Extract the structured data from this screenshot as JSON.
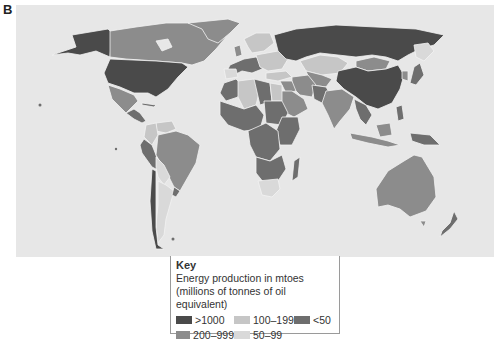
{
  "panel_label": "B",
  "legend": {
    "title": "Key",
    "subtitle_line1": "Energy production in mtoes",
    "subtitle_line2": "(millions of tonnes of oil equivalent)",
    "items": [
      {
        "label": ">1000",
        "color": "#4a4a4a"
      },
      {
        "label": "100–199",
        "color": "#c6c6c6"
      },
      {
        "label": "<50",
        "color": "#6e6e6e"
      },
      {
        "label": "200–999",
        "color": "#8c8c8c"
      },
      {
        "label": "50–99",
        "color": "#d9d9d9"
      }
    ]
  },
  "map": {
    "ocean_color": "#e7e7e7",
    "border_color": "#f2f2f2",
    "regions": [
      {
        "name": "United States",
        "category": ">1000"
      },
      {
        "name": "Russia",
        "category": ">1000"
      },
      {
        "name": "China",
        "category": ">1000"
      },
      {
        "name": "Canada",
        "category": "200–999"
      },
      {
        "name": "Greenland",
        "category": "200–999"
      },
      {
        "name": "Mexico",
        "category": "200–999"
      },
      {
        "name": "Brazil",
        "category": "200–999"
      },
      {
        "name": "India",
        "category": "200–999"
      },
      {
        "name": "Australia",
        "category": "200–999"
      },
      {
        "name": "Indonesia",
        "category": "200–999"
      },
      {
        "name": "Saudi Arabia",
        "category": "200–999"
      },
      {
        "name": "Iran",
        "category": "200–999"
      },
      {
        "name": "Mongolia",
        "category": "200–999"
      },
      {
        "name": "Kazakhstan",
        "category": "100–199"
      },
      {
        "name": "Algeria",
        "category": "100–199"
      },
      {
        "name": "Libya",
        "category": "100–199"
      },
      {
        "name": "Argentina",
        "category": "50–99"
      },
      {
        "name": "Venezuela",
        "category": "100–199"
      },
      {
        "name": "South Africa",
        "category": "100–199"
      },
      {
        "name": "Africa (most)",
        "category": "<50"
      },
      {
        "name": "South America (most)",
        "category": "<50"
      }
    ]
  }
}
